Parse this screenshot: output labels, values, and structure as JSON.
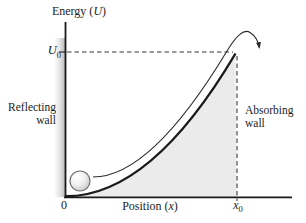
{
  "figure": {
    "y_axis_label": {
      "prefix": "Energy (",
      "symbol": "U",
      "suffix": ")"
    },
    "x_axis_label": {
      "prefix": "Position (",
      "symbol": "x",
      "suffix": ")"
    },
    "u0_label": {
      "symbol": "U",
      "sub": "0"
    },
    "x0_label": {
      "symbol": "x",
      "sub": "0"
    },
    "origin_label": "0",
    "reflecting_wall": {
      "line1": "Reflecting",
      "line2": "wall"
    },
    "absorbing_wall": {
      "line1": "Absorbing",
      "line2": "wall"
    },
    "colors": {
      "line": "#1a1a1a",
      "dashed_line": "#3a3a3a",
      "shaded_region": "#ebebeb",
      "wall_band": "#bfbfbf",
      "ball_edge": "#6f6f6f",
      "ball_shade": "#bdbdbd"
    }
  }
}
